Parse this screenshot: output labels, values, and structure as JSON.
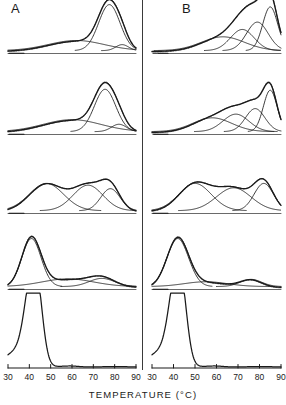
{
  "figure": {
    "type": "dsc-thermogram-deconvolution",
    "panel_labels": {
      "left": "A",
      "right": "B"
    },
    "axis_title": "TEMPERATURE  (°C)",
    "tick_values": [
      "30",
      "40",
      "50",
      "60",
      "70",
      "80",
      "90"
    ],
    "xlim": [
      30,
      90
    ],
    "rows": 5,
    "curve_color": "#1a1a1a",
    "fitted_color": "#555555",
    "baseline_color": "#444444"
  },
  "chart_data": {
    "type": "line",
    "title": "",
    "subtitle": "",
    "xlabel": "TEMPERATURE  (°C)",
    "ylabel": "",
    "xlim": [
      30,
      90
    ],
    "grid": false,
    "legend": "none",
    "x_ticks": [
      30,
      40,
      50,
      60,
      70,
      80,
      90
    ],
    "panels": [
      {
        "panel": "A",
        "row": 1,
        "experimental": {
          "name": "experimental endotherm",
          "peak_temps_c": [
            62,
            78
          ],
          "peak_heights": [
            0.22,
            1.0
          ]
        },
        "fitted_sum": {
          "name": "fitted sum (dotted)",
          "peak_temps_c": [
            78
          ],
          "peak_heights": [
            1.02
          ]
        },
        "components": [
          {
            "name": "component 1",
            "center_c": 62.0,
            "width_c": 13.0,
            "height": 0.22
          },
          {
            "name": "component 2",
            "center_c": 77.5,
            "width_c": 5.0,
            "height": 1.0
          },
          {
            "name": "component 3",
            "center_c": 83.5,
            "width_c": 3.0,
            "height": 0.13
          }
        ]
      },
      {
        "panel": "A",
        "row": 2,
        "experimental": {
          "name": "experimental endotherm",
          "peak_temps_c": [
            60,
            76
          ],
          "peak_heights": [
            0.26,
            0.92
          ]
        },
        "fitted_sum": {
          "name": "fitted sum (dotted)",
          "peak_temps_c": [
            76
          ],
          "peak_heights": [
            0.95
          ]
        },
        "components": [
          {
            "name": "component 1",
            "center_c": 60.0,
            "width_c": 13.5,
            "height": 0.26
          },
          {
            "name": "component 2",
            "center_c": 75.5,
            "width_c": 5.0,
            "height": 0.92
          },
          {
            "name": "component 3",
            "center_c": 82.0,
            "width_c": 3.5,
            "height": 0.16
          }
        ]
      },
      {
        "panel": "A",
        "row": 3,
        "experimental": {
          "name": "experimental endotherm",
          "peak_temps_c": [
            48,
            68,
            78
          ],
          "peak_heights": [
            0.62,
            0.58,
            0.5
          ]
        },
        "fitted_sum": {
          "name": "fitted sum (dotted)",
          "peak_temps_c": [
            48,
            68,
            78
          ],
          "peak_heights": [
            0.64,
            0.6,
            0.52
          ]
        },
        "components": [
          {
            "name": "component 1",
            "center_c": 48.0,
            "width_c": 8.0,
            "height": 0.62
          },
          {
            "name": "component 2",
            "center_c": 67.5,
            "width_c": 7.0,
            "height": 0.58
          },
          {
            "name": "component 3",
            "center_c": 78.0,
            "width_c": 4.5,
            "height": 0.5
          }
        ]
      },
      {
        "panel": "A",
        "row": 4,
        "experimental": {
          "name": "experimental endotherm",
          "peak_temps_c": [
            41,
            64,
            76
          ],
          "peak_heights": [
            1.0,
            0.16,
            0.17
          ]
        },
        "fitted_sum": {
          "name": "fitted sum (dotted)",
          "peak_temps_c": [
            41
          ],
          "peak_heights": [
            1.03
          ]
        },
        "components": [
          {
            "name": "component 1",
            "center_c": 41.0,
            "width_c": 4.5,
            "height": 1.0
          },
          {
            "name": "component 2",
            "center_c": 58.0,
            "width_c": 12.0,
            "height": 0.16
          },
          {
            "name": "component 3",
            "center_c": 74.0,
            "width_c": 6.0,
            "height": 0.17
          }
        ]
      },
      {
        "panel": "A",
        "row": 5,
        "experimental": {
          "name": "raw endotherm",
          "peak_temps_c": [
            41
          ],
          "peak_heights": [
            1.0
          ]
        },
        "fitted_sum": null,
        "components": []
      },
      {
        "panel": "B",
        "row": 1,
        "experimental": {
          "name": "experimental endotherm",
          "peak_temps_c": [
            63,
            72,
            80,
            85
          ],
          "peak_heights": [
            0.3,
            0.46,
            0.62,
            0.95
          ]
        },
        "fitted_sum": {
          "name": "fitted sum (dotted)",
          "peak_temps_c": [
            85
          ],
          "peak_heights": [
            0.97
          ]
        },
        "components": [
          {
            "name": "component 1",
            "center_c": 63.0,
            "width_c": 10.0,
            "height": 0.3
          },
          {
            "name": "component 2",
            "center_c": 72.0,
            "width_c": 5.5,
            "height": 0.46
          },
          {
            "name": "component 3",
            "center_c": 79.0,
            "width_c": 5.0,
            "height": 0.62
          },
          {
            "name": "component 4",
            "center_c": 85.0,
            "width_c": 3.5,
            "height": 0.95
          }
        ]
      },
      {
        "panel": "B",
        "row": 2,
        "experimental": {
          "name": "experimental endotherm",
          "peak_temps_c": [
            58,
            70,
            78,
            85
          ],
          "peak_heights": [
            0.3,
            0.38,
            0.5,
            0.9
          ]
        },
        "fitted_sum": {
          "name": "fitted sum (dotted)",
          "peak_temps_c": [
            85
          ],
          "peak_heights": [
            0.92
          ]
        },
        "components": [
          {
            "name": "component 1",
            "center_c": 58.0,
            "width_c": 9.0,
            "height": 0.3
          },
          {
            "name": "component 2",
            "center_c": 69.0,
            "width_c": 6.0,
            "height": 0.38
          },
          {
            "name": "component 3",
            "center_c": 78.0,
            "width_c": 4.5,
            "height": 0.5
          },
          {
            "name": "component 4",
            "center_c": 85.0,
            "width_c": 3.2,
            "height": 0.9
          }
        ]
      },
      {
        "panel": "B",
        "row": 3,
        "experimental": {
          "name": "experimental endotherm",
          "peak_temps_c": [
            50,
            68,
            82
          ],
          "peak_heights": [
            0.62,
            0.52,
            0.62
          ]
        },
        "fitted_sum": {
          "name": "fitted sum (dotted)",
          "peak_temps_c": [
            50,
            68,
            82
          ],
          "peak_heights": [
            0.64,
            0.54,
            0.64
          ]
        },
        "components": [
          {
            "name": "component 1",
            "center_c": 50.0,
            "width_c": 7.5,
            "height": 0.62
          },
          {
            "name": "component 2",
            "center_c": 68.0,
            "width_c": 8.0,
            "height": 0.52
          },
          {
            "name": "component 3",
            "center_c": 82.0,
            "width_c": 4.5,
            "height": 0.62
          }
        ]
      },
      {
        "panel": "B",
        "row": 4,
        "experimental": {
          "name": "experimental endotherm",
          "peak_temps_c": [
            42,
            76
          ],
          "peak_heights": [
            1.0,
            0.15
          ]
        },
        "fitted_sum": {
          "name": "fitted sum (dotted)",
          "peak_temps_c": [
            42
          ],
          "peak_heights": [
            1.02
          ]
        },
        "components": [
          {
            "name": "component 1",
            "center_c": 42.0,
            "width_c": 5.0,
            "height": 1.0
          },
          {
            "name": "component 2",
            "center_c": 55.0,
            "width_c": 10.0,
            "height": 0.1
          },
          {
            "name": "component 3",
            "center_c": 76.0,
            "width_c": 5.0,
            "height": 0.15
          }
        ]
      },
      {
        "panel": "B",
        "row": 5,
        "experimental": {
          "name": "raw endotherm",
          "peak_temps_c": [
            41
          ],
          "peak_heights": [
            1.0
          ]
        },
        "fitted_sum": null,
        "components": []
      }
    ]
  }
}
